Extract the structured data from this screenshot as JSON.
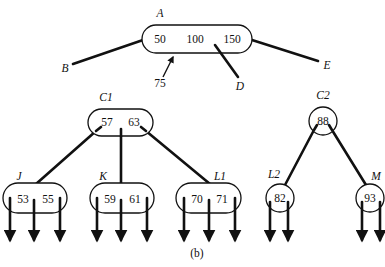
{
  "caption": "(b)",
  "top_node": {
    "label": "A",
    "values": [
      "50",
      "100",
      "150"
    ],
    "pointers": {
      "left": "B",
      "middle_right": "D",
      "right": "E"
    },
    "insert_key": "75"
  },
  "nodes": {
    "C1": {
      "label": "C1",
      "values": [
        "57",
        "63"
      ]
    },
    "C2": {
      "label": "C2",
      "values": [
        "88"
      ]
    },
    "J": {
      "label": "J",
      "values": [
        "53",
        "55"
      ]
    },
    "K": {
      "label": "K",
      "values": [
        "59",
        "61"
      ]
    },
    "L1": {
      "label": "L1",
      "values": [
        "70",
        "71"
      ]
    },
    "L2": {
      "label": "L2",
      "values": [
        "82"
      ]
    },
    "M": {
      "label": "M",
      "values": [
        "93"
      ]
    }
  },
  "colors": {
    "ink": "#111111",
    "background": "#ffffff"
  }
}
